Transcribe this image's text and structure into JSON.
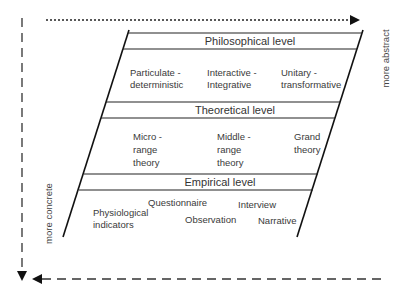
{
  "diagram": {
    "axes": {
      "abstract_label": "more abstract",
      "concrete_label": "more concrete"
    },
    "levels": [
      {
        "title": "Philosophical level",
        "items": [
          "Particulate -\ndeterministic",
          "Interactive -\nIntegrative",
          "Unitary -\ntransformative"
        ]
      },
      {
        "title": "Theoretical level",
        "items": [
          "Micro -\nrange\ntheory",
          "Middle -\nrange\ntheory",
          "Grand\ntheory"
        ]
      },
      {
        "title": "Empirical level",
        "items": [
          "Questionnaire",
          "Interview",
          "Physiological\nindicators",
          "Observation",
          "Narrative"
        ]
      }
    ],
    "colors": {
      "line": "#1a1a1a",
      "text": "#3a3a3a"
    }
  }
}
